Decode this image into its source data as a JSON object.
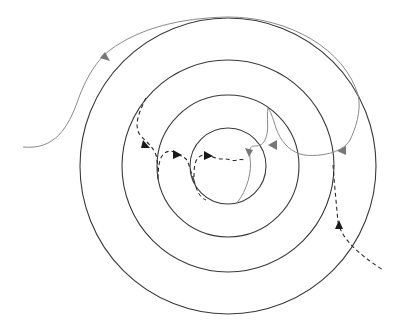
{
  "diagram": {
    "colors": {
      "background": "#ffffff",
      "circle_stroke": "#3a3a3a",
      "solid_path": "#8a8a8a",
      "dashed_path": "#2a2a2a",
      "arrow_dark": "#1a1a1a",
      "arrow_gray": "#777777"
    },
    "center": [
      228,
      166
    ],
    "circles": [
      {
        "id": "ring-1-outer",
        "r": 148
      },
      {
        "id": "ring-2",
        "r": 106
      },
      {
        "id": "ring-3",
        "r": 71
      },
      {
        "id": "ring-4-inner",
        "r": 38
      }
    ],
    "paths": [
      {
        "id": "gray-entry-path",
        "style": "solid",
        "color": "gray",
        "description": "Enters from left, rises along outer ring to top"
      },
      {
        "id": "gray-inner-path",
        "style": "solid",
        "color": "gray",
        "description": "Descends through right side rings into innermost circle"
      },
      {
        "id": "dashed-inner-path",
        "style": "dashed",
        "color": "dark",
        "description": "Winds from ring-2 toward innermost circle"
      },
      {
        "id": "dashed-exit-path",
        "style": "dashed",
        "color": "dark",
        "description": "Exits through lower right"
      }
    ]
  }
}
